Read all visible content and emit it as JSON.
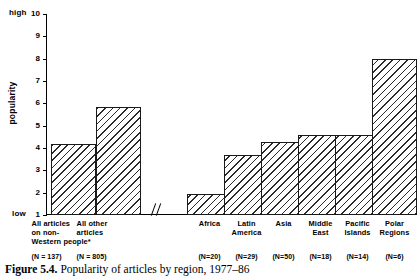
{
  "figure": {
    "caption_label": "Figure 5.4.",
    "caption_text": "Popularity of articles by region, 1977–86"
  },
  "axis": {
    "y_title": "popularity",
    "high_label": "high",
    "low_label": "low",
    "ticks": [
      "10",
      "9",
      "8",
      "7",
      "6",
      "5",
      "4",
      "3",
      "2",
      "1"
    ],
    "break_symbol": "//"
  },
  "chart_data": {
    "type": "bar",
    "title": "Popularity of articles by region, 1977–86",
    "xlabel": "",
    "ylabel": "popularity",
    "ylim": [
      1,
      10
    ],
    "grid": false,
    "legend": "none",
    "axis_break_after_index": 1,
    "categories": [
      "All articles on non-Western people*",
      "All other articles",
      "Africa",
      "Latin America",
      "Asia",
      "Middle East",
      "Pacific Islands",
      "Polar Regions"
    ],
    "category_lines": [
      [
        "All articles",
        "on non-",
        "Western people*"
      ],
      [
        "All other",
        "articles"
      ],
      [
        "Africa"
      ],
      [
        "Latin",
        "America"
      ],
      [
        "Asia"
      ],
      [
        "Middle",
        "East"
      ],
      [
        "Pacific",
        "Islands"
      ],
      [
        "Polar",
        "Regions"
      ]
    ],
    "values": [
      4.2,
      5.85,
      1.95,
      3.7,
      4.25,
      4.6,
      4.6,
      8.0
    ],
    "sample_labels": [
      "(N = 137)",
      "(N = 805)",
      "(N=20)",
      "(N=29)",
      "(N=50)",
      "(N=18)",
      "(N=14)",
      "(N=6)"
    ],
    "sample_sizes": [
      137,
      805,
      20,
      29,
      50,
      18,
      14,
      6
    ]
  },
  "style": {
    "ink": "#000000",
    "bar_fill": "#ffffff",
    "bar_hatch": "#2a2a2a",
    "background": "#ffffff"
  }
}
